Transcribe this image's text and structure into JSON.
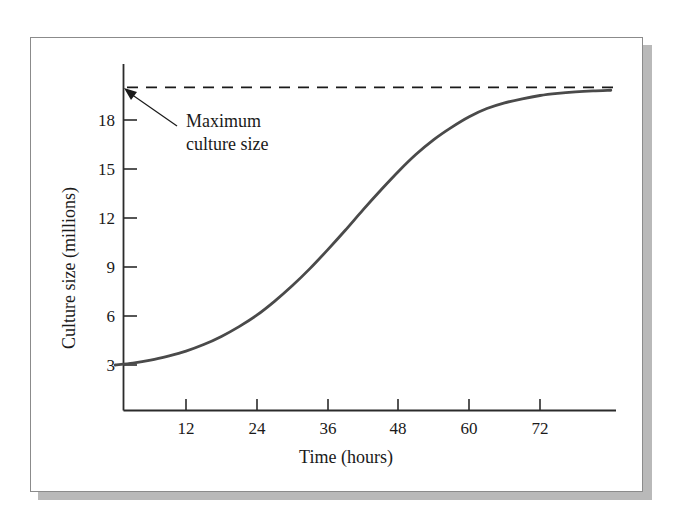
{
  "chart_data": {
    "type": "line",
    "title": "",
    "subtitle": "",
    "xlabel": "Time (hours)",
    "ylabel": "Culture size (millions)",
    "xlim": [
      0,
      84
    ],
    "ylim": [
      0,
      21
    ],
    "grid": false,
    "legend_position": "none",
    "x_ticks": [
      12,
      24,
      36,
      48,
      60,
      72
    ],
    "x_tick_labels": [
      "12",
      "24",
      "36",
      "48",
      "60",
      "72"
    ],
    "y_ticks": [
      3,
      6,
      9,
      12,
      15,
      18
    ],
    "y_tick_labels": [
      "3",
      "6",
      "9",
      "12",
      "15",
      "18"
    ],
    "series": [
      {
        "name": "Culture size",
        "color": "#4a4a4a",
        "style": "solid",
        "x": [
          0,
          3,
          6,
          9,
          12,
          15,
          18,
          21,
          24,
          27,
          30,
          33,
          36,
          39,
          42,
          45,
          48,
          51,
          54,
          57,
          60,
          63,
          66,
          69,
          72,
          75,
          78,
          81,
          84
        ],
        "y": [
          3.0,
          3.12,
          3.3,
          3.55,
          3.85,
          4.25,
          4.75,
          5.35,
          6.05,
          6.9,
          7.85,
          8.9,
          10.05,
          11.25,
          12.5,
          13.7,
          14.85,
          15.9,
          16.8,
          17.55,
          18.2,
          18.7,
          19.05,
          19.3,
          19.5,
          19.63,
          19.72,
          19.78,
          19.82
        ]
      }
    ],
    "reference_lines": [
      {
        "name": "Maximum culture size",
        "orientation": "horizontal",
        "value": 20,
        "style": "dashed",
        "color": "#1a1a1a"
      }
    ],
    "annotations": [
      {
        "text_line1": "Maximum",
        "text_line2": "culture size",
        "points_to": "maximum-culture-size-line",
        "arrow": true
      }
    ]
  },
  "chart": {
    "y_axis_title": "Culture size (millions)",
    "x_axis_title": "Time (hours)",
    "annotation": {
      "line1": "Maximum",
      "line2": "culture size"
    },
    "x_tick_labels": [
      "12",
      "24",
      "36",
      "48",
      "60",
      "72"
    ],
    "y_tick_labels": [
      "3",
      "6",
      "9",
      "12",
      "15",
      "18"
    ]
  },
  "colors": {
    "curve": "#4a4a4a",
    "axis": "#2b2b2b",
    "dashed": "#1a1a1a",
    "frame": "#8b8b8b",
    "shadow": "#b9b9b9",
    "background": "#ffffff"
  }
}
